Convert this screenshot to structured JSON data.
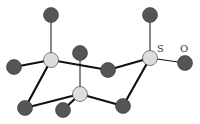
{
  "diagram": {
    "type": "molecular-structure",
    "labels": [
      {
        "id": "label-s",
        "text": "S",
        "x": 157,
        "y": 52
      },
      {
        "id": "label-o",
        "text": "O",
        "x": 180,
        "y": 52
      }
    ],
    "colors": {
      "dark_atom": "#555555",
      "light_atom": "#dddddd",
      "bond": "#111111",
      "atom_stroke": "#333333"
    },
    "atoms": [
      {
        "id": "a1",
        "kind": "dark",
        "x": 51,
        "y": 15
      },
      {
        "id": "a2",
        "kind": "dark",
        "x": 150,
        "y": 15
      },
      {
        "id": "a3",
        "kind": "light",
        "x": 51,
        "y": 60
      },
      {
        "id": "a4",
        "kind": "dark",
        "x": 14,
        "y": 67
      },
      {
        "id": "a5",
        "kind": "dark",
        "x": 80,
        "y": 53
      },
      {
        "id": "a6",
        "kind": "dark",
        "x": 108,
        "y": 70
      },
      {
        "id": "a7",
        "kind": "light",
        "x": 150,
        "y": 58,
        "label": "S"
      },
      {
        "id": "a8",
        "kind": "dark",
        "x": 185,
        "y": 63,
        "label": "O"
      },
      {
        "id": "a9",
        "kind": "light",
        "x": 80,
        "y": 94
      },
      {
        "id": "a10",
        "kind": "dark",
        "x": 25,
        "y": 108
      },
      {
        "id": "a11",
        "kind": "dark",
        "x": 63,
        "y": 110
      },
      {
        "id": "a12",
        "kind": "dark",
        "x": 123,
        "y": 106
      }
    ],
    "bonds": [
      {
        "from": "a1",
        "to": "a3",
        "weight": "thin"
      },
      {
        "from": "a2",
        "to": "a7",
        "weight": "thin"
      },
      {
        "from": "a3",
        "to": "a4",
        "weight": "thick"
      },
      {
        "from": "a3",
        "to": "a6",
        "weight": "thick"
      },
      {
        "from": "a3",
        "to": "a10",
        "weight": "thick"
      },
      {
        "from": "a5",
        "to": "a9",
        "weight": "thin"
      },
      {
        "from": "a6",
        "to": "a7",
        "weight": "thick"
      },
      {
        "from": "a7",
        "to": "a8",
        "weight": "thin"
      },
      {
        "from": "a7",
        "to": "a12",
        "weight": "thick"
      },
      {
        "from": "a9",
        "to": "a10",
        "weight": "thick"
      },
      {
        "from": "a9",
        "to": "a11",
        "weight": "thick"
      },
      {
        "from": "a9",
        "to": "a12",
        "weight": "thick"
      }
    ]
  }
}
